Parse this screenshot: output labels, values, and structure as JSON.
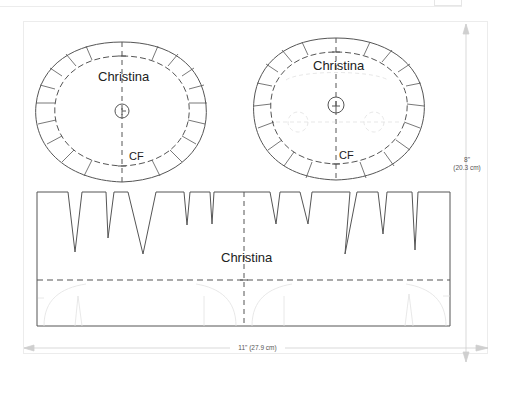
{
  "document": {
    "type": "printable-template",
    "page_width_label": "11\" (27.9 cm)",
    "page_height_label_in": "8\"",
    "page_height_label_cm": "(20.3 cm)"
  },
  "pieces": {
    "left_oval": {
      "name": "Christina",
      "marker": "CF"
    },
    "right_oval": {
      "name": "Christina",
      "marker": "CF"
    },
    "band": {
      "name": "Christina"
    }
  },
  "colors": {
    "line": "#555555",
    "faint": "#dddddd",
    "dimension": "#cccccc"
  }
}
